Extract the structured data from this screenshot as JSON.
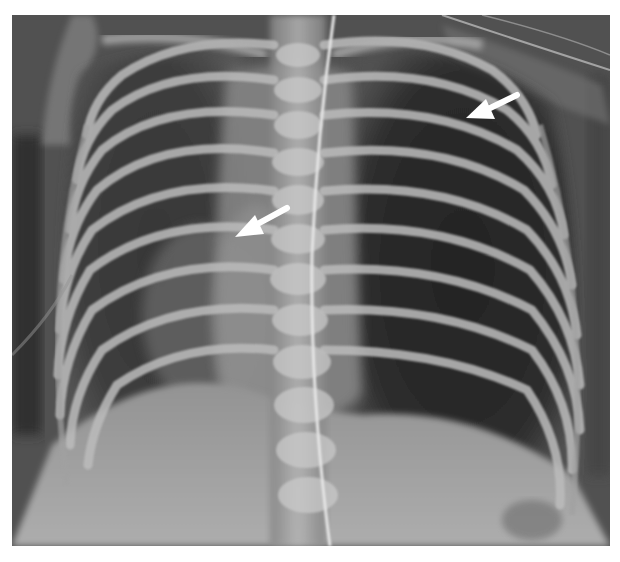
{
  "image": {
    "type": "chest radiograph (frontal view)",
    "background_color": "#ffffff",
    "film_base_color": "#5a5a5a",
    "bone_color": "#d8d8d8",
    "lung_dark_color": "#2e2e2e"
  },
  "annotations": {
    "arrows": [
      {
        "name": "arrow-right-hilar",
        "color": "#ffffff",
        "tip_x": 240,
        "tip_y": 230,
        "direction": "down-left"
      },
      {
        "name": "arrow-left-upper",
        "color": "#ffffff",
        "tip_x": 466,
        "tip_y": 117,
        "direction": "down-left"
      }
    ]
  },
  "caption": ""
}
